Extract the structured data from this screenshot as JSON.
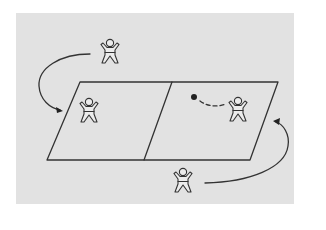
{
  "diagram": {
    "colors": {
      "background": "#e2e2e2",
      "line": "#333333",
      "ball": "#222222"
    },
    "court": {
      "shape": "parallelogram",
      "divisions": 2
    },
    "figures": [
      {
        "id": "player-top",
        "position": "outside-top-left",
        "pose": "arms-raised"
      },
      {
        "id": "player-left-court",
        "position": "inside-left-half",
        "pose": "arms-raised"
      },
      {
        "id": "player-right-court",
        "position": "inside-right-half",
        "pose": "arms-raised"
      },
      {
        "id": "player-bottom",
        "position": "outside-bottom-right",
        "pose": "arms-raised"
      }
    ],
    "ball": {
      "position": "right-half",
      "trajectory": "dashed-to-player-right-court"
    },
    "arrows": [
      {
        "id": "arrow-left",
        "from": "player-top",
        "to": "left-half",
        "direction": "counter-clockwise"
      },
      {
        "id": "arrow-right",
        "from": "player-bottom",
        "to": "right-half",
        "direction": "counter-clockwise"
      }
    ]
  }
}
